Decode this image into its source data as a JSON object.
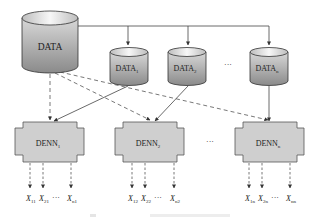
{
  "diagram": {
    "source": {
      "label": "DATA"
    },
    "subsets": [
      {
        "base": "DATA",
        "sub": "1"
      },
      {
        "base": "DATA",
        "sub": "2"
      },
      {
        "base": "DATA",
        "sub": "n"
      }
    ],
    "subset_ellipsis": "···",
    "networks": [
      {
        "base": "DENN",
        "sub": "1",
        "outputs": [
          {
            "base": "X",
            "sub": "11"
          },
          {
            "base": "X",
            "sub": "21"
          },
          {
            "base": "X",
            "sub": "n1"
          }
        ]
      },
      {
        "base": "DENN",
        "sub": "2",
        "outputs": [
          {
            "base": "X",
            "sub": "12"
          },
          {
            "base": "X",
            "sub": "22"
          },
          {
            "base": "X",
            "sub": "n2"
          }
        ]
      },
      {
        "base": "DENN",
        "sub": "n",
        "outputs": [
          {
            "base": "X",
            "sub": "1n"
          },
          {
            "base": "X",
            "sub": "2n"
          },
          {
            "base": "X",
            "sub": "nn"
          }
        ]
      }
    ],
    "network_ellipsis": "···",
    "output_ellipsis": "···",
    "colors": {
      "cylinder_top": "#f2f2f2",
      "cylinder_body_light": "#e0e0e0",
      "cylinder_body_dark": "#8a8a8a",
      "box_fill": "#cfcfcf",
      "line": "#444444"
    }
  }
}
